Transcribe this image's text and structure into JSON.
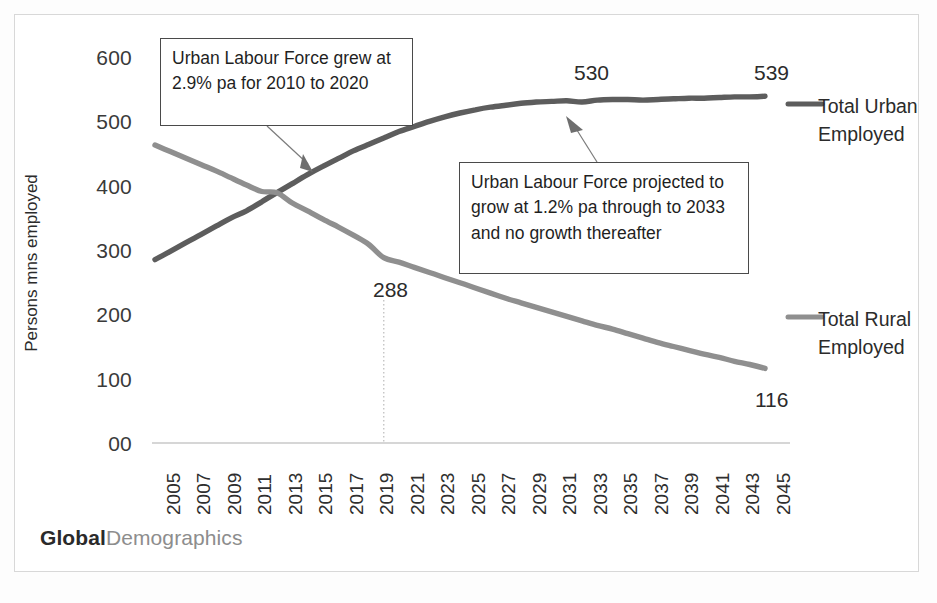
{
  "watermark": {
    "bold_part": "Global",
    "light_part": "Demographics"
  },
  "annotations": [
    {
      "id": "urban-historic-growth",
      "text": "Urban Labour Force grew at 2.9% pa for 2010 to 2020"
    },
    {
      "id": "urban-projected-growth",
      "text": "Urban Labour Force projected to grow at 1.2% pa through to 2033 and no growth thereafter"
    }
  ],
  "legend": {
    "urban_label": "Total Urban Employed",
    "rural_label": "Total Rural Employed"
  },
  "point_labels": {
    "urban_2033": "530",
    "urban_2045": "539",
    "rural_2020": "288",
    "rural_2045": "116"
  },
  "colors": {
    "urban_line": "#5d5d5d",
    "rural_line": "#8f8f8f",
    "axis": "#c9c9c9",
    "callout_border": "#4a4a4a",
    "text": "#2b2b2b",
    "watermark_bold": "#2a2a2a",
    "watermark_light": "#8d8d8d"
  },
  "chart_data": {
    "type": "line",
    "title": "",
    "subtitle": "",
    "xlabel": "",
    "ylabel": "Persons mns employed",
    "xlim": [
      2005,
      2045
    ],
    "ylim": [
      0,
      600
    ],
    "grid": false,
    "legend_position": "right",
    "ytick_labels": [
      "00",
      "100",
      "200",
      "300",
      "400",
      "500",
      "600"
    ],
    "ytick_values": [
      0,
      100,
      200,
      300,
      400,
      500,
      600
    ],
    "xtick_labels": [
      "2005",
      "2007",
      "2009",
      "2011",
      "2013",
      "2015",
      "2017",
      "2019",
      "2021",
      "2023",
      "2025",
      "2027",
      "2029",
      "2031",
      "2033",
      "2035",
      "2037",
      "2039",
      "2041",
      "2043",
      "2045"
    ],
    "x": [
      2005,
      2006,
      2007,
      2008,
      2009,
      2010,
      2011,
      2012,
      2013,
      2014,
      2015,
      2016,
      2017,
      2018,
      2019,
      2020,
      2021,
      2022,
      2023,
      2024,
      2025,
      2026,
      2027,
      2028,
      2029,
      2030,
      2031,
      2032,
      2033,
      2034,
      2035,
      2036,
      2037,
      2038,
      2039,
      2040,
      2041,
      2042,
      2043,
      2044,
      2045
    ],
    "series": [
      {
        "name": "Total Urban Employed",
        "color": "#5d5d5d",
        "values": [
          285,
          298,
          311,
          324,
          337,
          350,
          361,
          375,
          389,
          403,
          417,
          430,
          442,
          454,
          464,
          474,
          484,
          492,
          500,
          507,
          513,
          518,
          522,
          525,
          528,
          530,
          531,
          532,
          530,
          533,
          534,
          534,
          533,
          534,
          535,
          536,
          536,
          537,
          538,
          538,
          539
        ]
      },
      {
        "name": "Total Rural Employed",
        "color": "#8f8f8f",
        "values": [
          463,
          453,
          443,
          433,
          423,
          412,
          401,
          391,
          389,
          373,
          361,
          348,
          336,
          323,
          309,
          288,
          281,
          273,
          265,
          257,
          249,
          241,
          233,
          225,
          218,
          211,
          204,
          197,
          190,
          183,
          177,
          170,
          163,
          156,
          150,
          144,
          138,
          133,
          127,
          122,
          116
        ]
      }
    ],
    "annotations": [
      {
        "text": "Urban Labour Force grew at 2.9% pa for 2010 to 2020",
        "points_at_year": 2013,
        "points_at_value": 400
      },
      {
        "text": "Urban Labour Force projected to grow at 1.2% pa through to 2033 and no growth thereafter",
        "points_at_year": 2032,
        "points_at_value": 530
      }
    ],
    "reference_line": {
      "type": "vertical-dotted",
      "at_year": 2020,
      "label": "288"
    },
    "point_labels": [
      {
        "series": "Total Urban Employed",
        "year": 2033,
        "value": 530,
        "text": "530"
      },
      {
        "series": "Total Urban Employed",
        "year": 2045,
        "value": 539,
        "text": "539"
      },
      {
        "series": "Total Rural Employed",
        "year": 2020,
        "value": 288,
        "text": "288"
      },
      {
        "series": "Total Rural Employed",
        "year": 2045,
        "value": 116,
        "text": "116"
      }
    ]
  }
}
